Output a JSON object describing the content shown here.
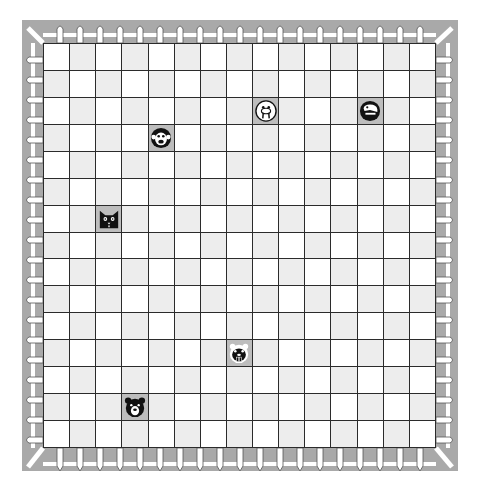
{
  "board": {
    "rows": 15,
    "cols": 15,
    "colors": {
      "light": "#ffffff",
      "dark": "#ededed",
      "occupied": "#bdbdbd",
      "grid_line": "#2b2b2b",
      "frame": "#a9a9a9",
      "fence": "#ffffff"
    }
  },
  "pieces": [
    {
      "animal": "walrus",
      "icon": "walrus-icon",
      "row": 2,
      "col": 8,
      "style": "light"
    },
    {
      "animal": "dinosaur",
      "icon": "dinosaur-icon",
      "row": 2,
      "col": 12,
      "style": "dark"
    },
    {
      "animal": "monkey",
      "icon": "monkey-icon",
      "row": 3,
      "col": 4,
      "style": "dark"
    },
    {
      "animal": "cat",
      "icon": "cat-icon",
      "row": 6,
      "col": 2,
      "style": "dark"
    },
    {
      "animal": "beaver",
      "icon": "beaver-icon",
      "row": 11,
      "col": 7,
      "style": "light"
    },
    {
      "animal": "bear",
      "icon": "bear-icon",
      "row": 13,
      "col": 3,
      "style": "dark"
    }
  ]
}
